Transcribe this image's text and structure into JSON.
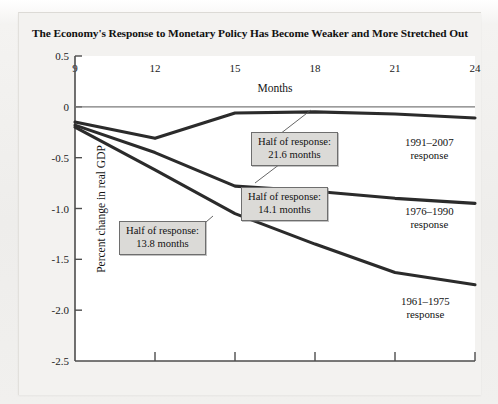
{
  "chart_data": {
    "type": "line",
    "title": "The Economy's Response to Monetary Policy Has Become Weaker and More Stretched Out",
    "xlabel": "Months",
    "ylabel": "Percent change in real GDP",
    "xlim": [
      9,
      24
    ],
    "ylim": [
      -2.5,
      0.5
    ],
    "xticks": [
      "9",
      "12",
      "15",
      "18",
      "21",
      "24"
    ],
    "yticks": [
      "0.5",
      "0",
      "-0.5",
      "-1.0",
      "-1.5",
      "-2.0",
      "-2.5"
    ],
    "grid": false,
    "legend_position": "inline-right",
    "zero_line": true,
    "series": [
      {
        "name": "1991-2007 response",
        "label": "1991–2007",
        "label_line2": "response",
        "half_response_months": 21.6,
        "x": [
          9,
          12,
          15,
          18,
          21,
          24
        ],
        "values": [
          -0.15,
          -0.31,
          -0.06,
          -0.05,
          -0.07,
          -0.11
        ]
      },
      {
        "name": "1976-1990 response",
        "label": "1976–1990",
        "label_line2": "response",
        "half_response_months": 14.1,
        "x": [
          9,
          12,
          15,
          18,
          21,
          24
        ],
        "values": [
          -0.18,
          -0.45,
          -0.78,
          -0.83,
          -0.9,
          -0.95
        ]
      },
      {
        "name": "1961-1975 response",
        "label": "1961–1975",
        "label_line2": "response",
        "half_response_months": 13.8,
        "x": [
          9,
          12,
          15,
          18,
          21,
          24
        ],
        "values": [
          -0.2,
          -0.62,
          -1.05,
          -1.35,
          -1.63,
          -1.75
        ]
      }
    ],
    "annotations": [
      {
        "line1": "Half of response:",
        "line2": "21.6 months"
      },
      {
        "line1": "Half of response:",
        "line2": "14.1 months"
      },
      {
        "line1": "Half of response:",
        "line2": "13.8 months"
      }
    ],
    "colors": {
      "line": "#2b2b2b",
      "axis": "#555555",
      "callout_fill": "#dbdad7",
      "plot_bg": "#ffffff"
    }
  }
}
